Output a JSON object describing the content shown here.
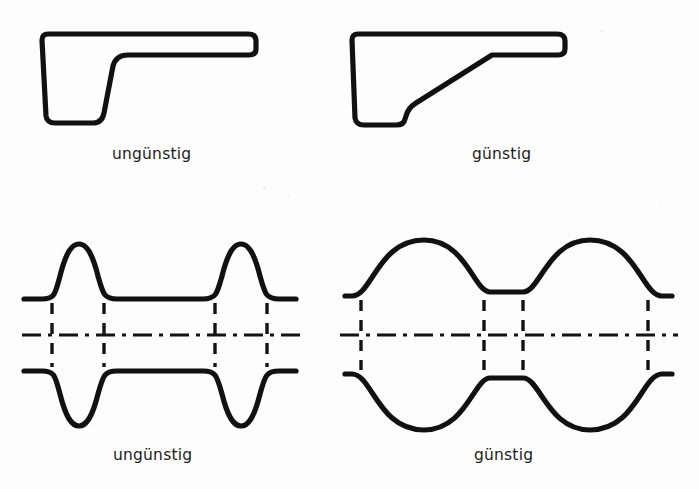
{
  "figure": {
    "background_color": "#fdfdfd",
    "line_color": "#111111",
    "panels": [
      {
        "id": "top-left",
        "caption": "ungünstig",
        "shape": "bracket-with-abrupt-step",
        "description": "Konsole mit schroffem Absatz und scharfem Innenübergang"
      },
      {
        "id": "top-right",
        "caption": "günstig",
        "shape": "bracket-with-diagonal-taper",
        "description": "Konsole mit allmählichem schrägem Übergang"
      },
      {
        "id": "bottom-left",
        "caption": "ungünstig",
        "shape": "shaft-with-narrow-collars",
        "description": "Welle mit schmalen, steilen Bunden und scharfen Querschnittssprüngen"
      },
      {
        "id": "bottom-right",
        "caption": "günstig",
        "shape": "shaft-with-smooth-waves",
        "description": "Welle mit weichen, sinusförmigen Querschnittsübergängen"
      }
    ]
  },
  "captions": {
    "top_left": "ungünstig",
    "top_right": "günstig",
    "bottom_left": "ungünstig",
    "bottom_right": "günstig"
  }
}
